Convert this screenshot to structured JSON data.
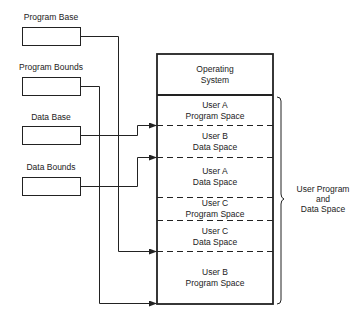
{
  "registers": [
    {
      "label": "Program Base",
      "box": [
        22,
        27,
        58,
        18
      ],
      "label_x": 51,
      "label_y": 13
    },
    {
      "label": "Program Bounds",
      "box": [
        22,
        77,
        58,
        18
      ],
      "label_x": 51,
      "label_y": 63
    },
    {
      "label": "Data Base",
      "box": [
        22,
        126,
        58,
        18
      ],
      "label_x": 51,
      "label_y": 113
    },
    {
      "label": "Data Bounds",
      "box": [
        22,
        177,
        58,
        18
      ],
      "label_x": 51,
      "label_y": 163
    }
  ],
  "memory": {
    "segments": [
      {
        "line1": "Operating",
        "line2": "System",
        "top": 54,
        "bottom": 95
      },
      {
        "line1": "User A",
        "line2": "Program Space",
        "top": 95,
        "bottom": 125
      },
      {
        "line1": "User B",
        "line2": "Data Space",
        "top": 125,
        "bottom": 157
      },
      {
        "line1": "User A",
        "line2": "Data Space",
        "top": 157,
        "bottom": 197
      },
      {
        "line1": "User C",
        "line2": "Program Space",
        "top": 197,
        "bottom": 220
      },
      {
        "line1": "User C",
        "line2": "Data Space",
        "top": 220,
        "bottom": 251
      },
      {
        "line1": "User B",
        "line2": "Program Space",
        "top": 251,
        "bottom": 304
      }
    ]
  },
  "bracket_label": {
    "line1": "User Program",
    "line2": "and",
    "line3": "Data Space"
  }
}
